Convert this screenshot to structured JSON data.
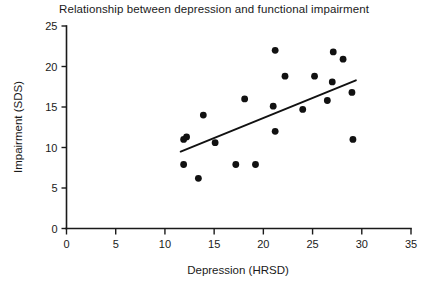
{
  "chart_data": {
    "type": "scatter",
    "title": "Relationship between depression and functional impairment",
    "xlabel": "Depression (HRSD)",
    "ylabel": "Impairment (SDS)",
    "xlim": [
      0,
      35
    ],
    "ylim": [
      0,
      25
    ],
    "xticks": [
      0,
      5,
      10,
      15,
      20,
      25,
      30,
      35
    ],
    "yticks": [
      0,
      5,
      10,
      15,
      20,
      25
    ],
    "grid": false,
    "legend": null,
    "marker": "filled-circle",
    "marker_color": "#111111",
    "points": [
      {
        "x": 11.9,
        "y": 11.0
      },
      {
        "x": 11.9,
        "y": 7.9
      },
      {
        "x": 12.2,
        "y": 11.3
      },
      {
        "x": 13.4,
        "y": 6.2
      },
      {
        "x": 13.9,
        "y": 14.0
      },
      {
        "x": 15.1,
        "y": 10.6
      },
      {
        "x": 17.2,
        "y": 7.9
      },
      {
        "x": 18.1,
        "y": 16.0
      },
      {
        "x": 19.2,
        "y": 7.9
      },
      {
        "x": 21.0,
        "y": 15.1
      },
      {
        "x": 21.2,
        "y": 22.0
      },
      {
        "x": 21.2,
        "y": 12.0
      },
      {
        "x": 22.2,
        "y": 18.8
      },
      {
        "x": 24.0,
        "y": 14.7
      },
      {
        "x": 25.2,
        "y": 18.8
      },
      {
        "x": 26.5,
        "y": 15.8
      },
      {
        "x": 27.0,
        "y": 18.1
      },
      {
        "x": 27.1,
        "y": 21.8
      },
      {
        "x": 28.1,
        "y": 20.9
      },
      {
        "x": 29.0,
        "y": 16.8
      },
      {
        "x": 29.1,
        "y": 11.0
      }
    ],
    "fit_line": {
      "name": "regression-line",
      "x0": 11.6,
      "y0": 9.5,
      "x1": 29.4,
      "y1": 18.3,
      "color": "#111111"
    }
  },
  "axes": {
    "x_tick_labels": [
      "0",
      "5",
      "10",
      "15",
      "20",
      "25",
      "30",
      "35"
    ],
    "y_tick_labels": [
      "0",
      "5",
      "10",
      "15",
      "20",
      "25"
    ]
  }
}
